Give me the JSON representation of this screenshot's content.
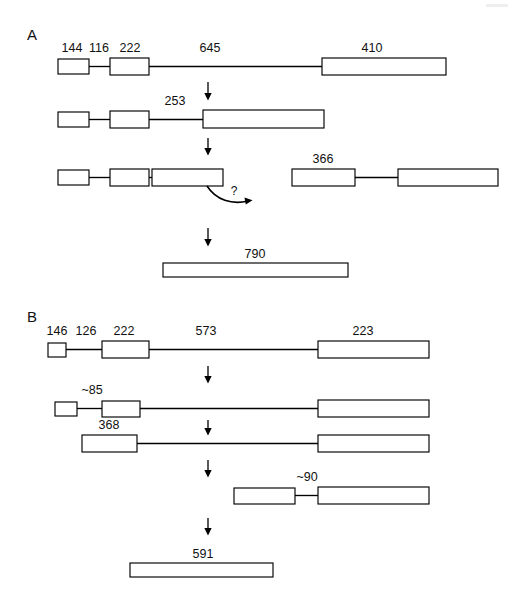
{
  "figure": {
    "background_color": "#ffffff",
    "ink_color": "#000000",
    "panels": [
      {
        "id": "A",
        "letter": "A",
        "rows": [
          {
            "id": "a-row-1",
            "labels": [
              "144",
              "116",
              "222",
              "645",
              "410"
            ]
          },
          {
            "id": "a-row-2",
            "labels": [
              "253"
            ]
          },
          {
            "id": "a-row-3",
            "labels": [
              "366",
              "?"
            ]
          },
          {
            "id": "a-row-4",
            "labels": [
              "790"
            ]
          }
        ]
      },
      {
        "id": "B",
        "letter": "B",
        "rows": [
          {
            "id": "b-row-1",
            "labels": [
              "146",
              "126",
              "222",
              "573",
              "223"
            ]
          },
          {
            "id": "b-row-2",
            "labels": [
              "~85"
            ]
          },
          {
            "id": "b-row-3",
            "labels": [
              "368"
            ]
          },
          {
            "id": "b-row-4",
            "labels": [
              "~90"
            ]
          },
          {
            "id": "b-row-5",
            "labels": [
              "591"
            ]
          }
        ]
      }
    ]
  },
  "panelA": {
    "letter": "A",
    "row1": {
      "label_144": "144",
      "label_116": "116",
      "label_222": "222",
      "label_645": "645",
      "label_410": "410"
    },
    "row2": {
      "label_253": "253"
    },
    "row3": {
      "label_366": "366",
      "label_question": "?"
    },
    "row4": {
      "label_790": "790"
    }
  },
  "panelB": {
    "letter": "B",
    "row1": {
      "label_146": "146",
      "label_126": "126",
      "label_222": "222",
      "label_573": "573",
      "label_223": "223"
    },
    "row2": {
      "label_85": "~85"
    },
    "row3": {
      "label_368": "368"
    },
    "row4": {
      "label_90": "~90"
    },
    "row5": {
      "label_591": "591"
    }
  }
}
